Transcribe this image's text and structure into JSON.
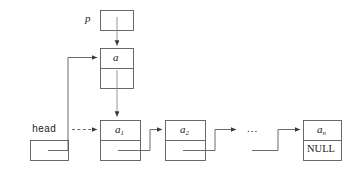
{
  "diagram": {
    "colors": {
      "stroke": "#5a5a5a",
      "text": "#222222",
      "background": "#ffffff"
    },
    "pointer_box": {
      "label": "p",
      "cells": [
        "",
        ""
      ]
    },
    "new_node": {
      "data": "a",
      "pointer_cell": ""
    },
    "head_box": {
      "label": "head",
      "cell": ""
    },
    "nodes": [
      {
        "data": "a",
        "subscript": "1",
        "pointer_cell": ""
      },
      {
        "data": "a",
        "subscript": "2",
        "pointer_cell": ""
      },
      {
        "data": "a",
        "subscript": "n",
        "pointer_cell": "NULL"
      }
    ],
    "ellipsis": "...",
    "null_text": "NULL"
  }
}
